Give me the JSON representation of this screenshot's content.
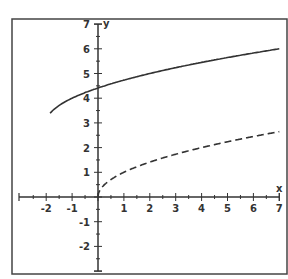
{
  "chart_data": {
    "type": "line",
    "title": "",
    "xlabel": "x",
    "ylabel": "y",
    "xlim": [
      -2.6,
      7
    ],
    "ylim": [
      -3,
      7
    ],
    "grid": false,
    "x_ticks": [
      -2,
      -1,
      1,
      2,
      3,
      4,
      5,
      6,
      7
    ],
    "x_tick_labels": [
      "-2",
      "-1",
      "1",
      "2",
      "3",
      "4",
      "5",
      "6",
      "7"
    ],
    "y_ticks": [
      -2,
      -1,
      1,
      2,
      3,
      4,
      5,
      6,
      7
    ],
    "y_tick_labels": [
      "-2",
      "-1",
      "1",
      "2",
      "3",
      "4",
      "5",
      "6",
      "7"
    ],
    "series": [
      {
        "name": "solid curve",
        "style": "solid",
        "color": "#333333",
        "x": [
          -2,
          -1.75,
          -1.5,
          -1,
          -0.5,
          0,
          1,
          2,
          3,
          4,
          5,
          6,
          7
        ],
        "values": [
          3.0,
          3.5,
          3.71,
          4.0,
          4.22,
          4.41,
          4.73,
          5.0,
          5.24,
          5.45,
          5.65,
          5.83,
          6.0
        ]
      },
      {
        "name": "dashed curve",
        "style": "dashed",
        "color": "#333333",
        "x": [
          0,
          0.1,
          0.25,
          0.5,
          1,
          2,
          3,
          4,
          5,
          6,
          7
        ],
        "values": [
          0,
          0.32,
          0.5,
          0.71,
          1.0,
          1.41,
          1.73,
          2.0,
          2.24,
          2.45,
          2.65
        ]
      }
    ],
    "legend": null
  },
  "axes": {
    "x_label": "x",
    "y_label": "y"
  }
}
